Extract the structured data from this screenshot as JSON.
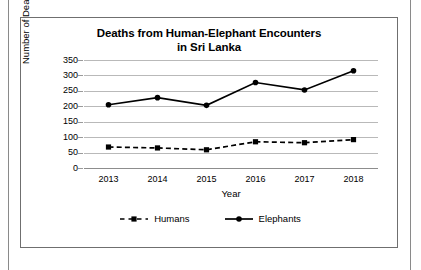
{
  "figure": {
    "title_line1": "Deaths from Human-Elephant Encounters",
    "title_line2": "in Sri Lanka"
  },
  "chart_data": {
    "type": "line",
    "title": "Deaths from Human-Elephant Encounters in Sri Lanka",
    "xlabel": "Year",
    "ylabel": "Number of Deaths",
    "categories": [
      "2013",
      "2014",
      "2015",
      "2016",
      "2017",
      "2018"
    ],
    "yticks": [
      "0",
      "50",
      "100",
      "150",
      "200",
      "250",
      "300",
      "350"
    ],
    "ylim": [
      0,
      350
    ],
    "grid": true,
    "legend_position": "bottom",
    "series": [
      {
        "name": "Humans",
        "values": [
          68,
          65,
          59,
          85,
          82,
          92
        ],
        "line_style": "dashed",
        "marker": "square",
        "color": "#000000"
      },
      {
        "name": "Elephants",
        "values": [
          205,
          228,
          203,
          277,
          253,
          315
        ],
        "line_style": "solid",
        "marker": "circle",
        "color": "#000000"
      }
    ]
  }
}
